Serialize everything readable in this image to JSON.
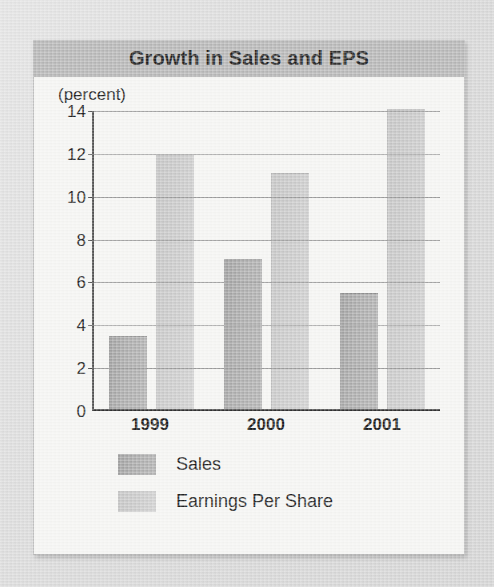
{
  "figure": {
    "title": "Growth in Sales and EPS",
    "unit_label": "(percent)",
    "legend": {
      "sales_label": "Sales",
      "eps_label": "Earnings Per Share"
    },
    "colors": {
      "title_band": "#b4b4b4",
      "card_background": "#f2f2f0",
      "page_background": "#d9d9d9",
      "sales_bar": "#a9a9a9",
      "eps_bar": "#c8c8c8",
      "gridline": "#9a9a9a",
      "axis": "#2e2e2e"
    }
  },
  "chart_data": {
    "type": "bar",
    "title": "Growth in Sales and EPS",
    "xlabel": "",
    "ylabel": "(percent)",
    "ylim": [
      0,
      14
    ],
    "ytick_labels": [
      "0",
      "2",
      "4",
      "6",
      "8",
      "10",
      "12",
      "14"
    ],
    "ytick_values": [
      0,
      2,
      4,
      6,
      8,
      10,
      12,
      14
    ],
    "grid": true,
    "legend_position": "below-axis-left",
    "categories": [
      "1999",
      "2000",
      "2001"
    ],
    "series": [
      {
        "name": "Sales",
        "values": [
          3.4,
          7.0,
          5.4
        ],
        "color": "#a9a9a9"
      },
      {
        "name": "Earnings Per Share",
        "values": [
          11.9,
          11.0,
          14.0
        ],
        "color": "#c8c8c8"
      }
    ]
  }
}
